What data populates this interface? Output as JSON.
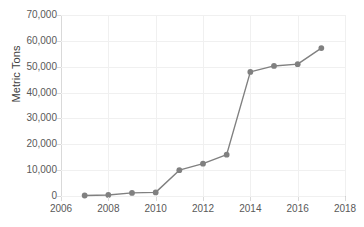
{
  "chart_data": {
    "type": "line",
    "title": "",
    "xlabel": "",
    "ylabel": "Metric Tons",
    "x": [
      2007,
      2008,
      2009,
      2010,
      2011,
      2012,
      2013,
      2014,
      2015,
      2016,
      2017
    ],
    "values": [
      200,
      400,
      1200,
      1400,
      10000,
      12500,
      16000,
      48000,
      50300,
      51000,
      57200
    ],
    "series": [
      {
        "name": "Metric Tons",
        "values": [
          200,
          400,
          1200,
          1400,
          10000,
          12500,
          16000,
          48000,
          50300,
          51000,
          57200
        ]
      }
    ],
    "xlim": [
      2006,
      2018
    ],
    "ylim": [
      0,
      70000
    ],
    "xticks": [
      2006,
      2008,
      2010,
      2012,
      2014,
      2016,
      2018
    ],
    "yticks": [
      0,
      10000,
      20000,
      30000,
      40000,
      50000,
      60000,
      70000
    ],
    "xtick_labels": [
      "2006",
      "2008",
      "2010",
      "2012",
      "2014",
      "2016",
      "2018"
    ],
    "ytick_labels": [
      "0",
      "10,000",
      "20,000",
      "30,000",
      "40,000",
      "50,000",
      "60,000",
      "70,000"
    ],
    "grid": true,
    "grid_axis": "both",
    "legend": false,
    "legend_position": "none",
    "marker": "circle",
    "series_color": "#808080",
    "grid_color": "#f0f0f0",
    "axis_color": "#d9d9d9",
    "tick_label_color": "#595959",
    "axis_title_color": "#404040",
    "background_color": "#ffffff"
  },
  "axes": {
    "y_title": "Metric Tons"
  }
}
